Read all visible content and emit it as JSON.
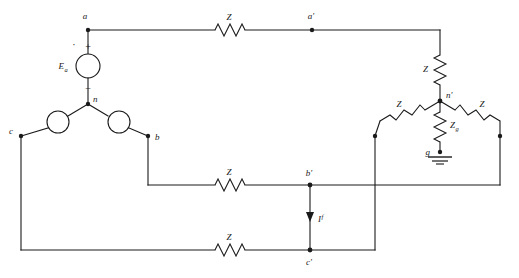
{
  "figure": {
    "kind": "circuit-diagram",
    "width": 519,
    "height": 278,
    "background_color": "#ffffff",
    "line_color": "#1a1a1a"
  },
  "nodes": {
    "a": "a",
    "a_prime": "a'",
    "b": "b",
    "b_prime": "b'",
    "c": "c",
    "c_prime": "c'",
    "n": "n",
    "n_prime": "n'",
    "g": "g"
  },
  "sources": {
    "phase_a_label": "E",
    "phase_a_subscript": "a",
    "plus_sign": "+",
    "minus_sign": "−"
  },
  "impedances": {
    "line_a": "Z",
    "line_b": "Z",
    "line_c": "Z",
    "load_a": "Z",
    "load_b": "Z",
    "load_c": "Z",
    "ground_label": "Z",
    "ground_subscript": "g"
  },
  "currents": {
    "fault_label": "I",
    "fault_superscript": "f",
    "fault_direction": "down"
  },
  "symbols": {
    "ground": "earth-ground",
    "polarity_dot": "·"
  }
}
